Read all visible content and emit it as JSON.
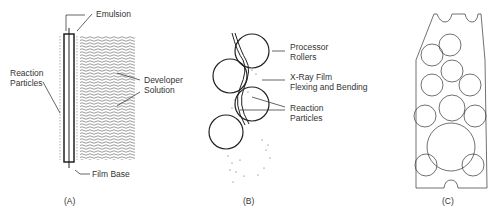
{
  "panels": {
    "a": {
      "caption": "(A)",
      "labels": {
        "emulsion": "Emulsion",
        "reaction_particles_1": "Reaction",
        "reaction_particles_2": "Particles",
        "developer_solution_1": "Developer",
        "developer_solution_2": "Solution",
        "film_base": "Film Base"
      }
    },
    "b": {
      "caption": "(B)",
      "labels": {
        "processor_rollers_1": "Processor",
        "processor_rollers_2": "Rollers",
        "xray_film_1": "X-Ray Film",
        "xray_film_2": "Flexing and Bending",
        "reaction_particles_1": "Reaction",
        "reaction_particles_2": "Particles"
      }
    },
    "c": {
      "caption": "(C)",
      "roller_labels": [
        "C",
        "F",
        "C",
        "E",
        "C",
        "D",
        "C",
        "C",
        "B",
        "A",
        "A"
      ]
    }
  },
  "colors": {
    "line": "#222222",
    "text": "#333333",
    "background": "#ffffff"
  }
}
